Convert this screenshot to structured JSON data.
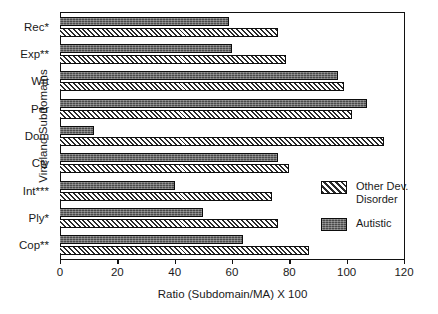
{
  "chart_data": {
    "type": "bar",
    "orientation": "horizontal",
    "title": "",
    "xlabel": "Ratio (Subdomain/MA) X 100",
    "ylabel": "Vineland Subdomains",
    "xlim": [
      0,
      120
    ],
    "xticks": [
      0,
      20,
      40,
      60,
      80,
      100,
      120
    ],
    "xtick_labels": [
      "0",
      "20",
      "40",
      "60",
      "80",
      "100",
      "120"
    ],
    "grid": false,
    "legend_position": "right-inside",
    "categories": [
      "Rec*",
      "Exp**",
      "Wrt",
      "Per",
      "Dom",
      "Cty",
      "Int***",
      "Ply*",
      "Cop**"
    ],
    "series": [
      {
        "name": "Other Dev. Disorder",
        "fill": "diagonal-hatch",
        "color": "#2b2b2b",
        "values": [
          76,
          79,
          99,
          102,
          113,
          80,
          74,
          76,
          87
        ]
      },
      {
        "name": "Autistic",
        "fill": "dark-stipple",
        "color": "#4a4a4a",
        "values": [
          59,
          60,
          97,
          107,
          12,
          76,
          40,
          50,
          64
        ]
      }
    ]
  },
  "legend": {
    "entries": [
      {
        "label": "Other Dev.\nDisorder",
        "key": "other"
      },
      {
        "label": "Autistic",
        "key": "autistic"
      }
    ]
  }
}
